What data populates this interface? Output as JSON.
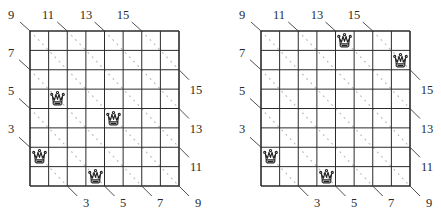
{
  "figure": {
    "grid_size": 8,
    "colors": {
      "grid_line": "#2b2b2b",
      "diagonal_dots": "#b8b8b8",
      "leader_line": "#3a3a3a",
      "label_text": "#2a2a2a",
      "queen_stroke": "#222222"
    }
  },
  "boards": [
    {
      "id": "left",
      "top_labels": [
        "9",
        "11",
        "13",
        "15"
      ],
      "left_labels": [
        "7",
        "5",
        "3"
      ],
      "right_labels": [
        "15",
        "13",
        "11",
        "9"
      ],
      "bottom_labels": [
        "3",
        "5",
        "7"
      ],
      "queens": [
        {
          "row": 3,
          "col": 1
        },
        {
          "row": 4,
          "col": 4
        },
        {
          "row": 6,
          "col": 0
        },
        {
          "row": 7,
          "col": 3
        }
      ]
    },
    {
      "id": "right",
      "top_labels": [
        "9",
        "11",
        "13",
        "15"
      ],
      "left_labels": [
        "7",
        "5",
        "3"
      ],
      "right_labels": [
        "15",
        "13",
        "11",
        "9"
      ],
      "bottom_labels": [
        "3",
        "5",
        "7"
      ],
      "queens": [
        {
          "row": 0,
          "col": 4
        },
        {
          "row": 1,
          "col": 7
        },
        {
          "row": 6,
          "col": 0
        },
        {
          "row": 7,
          "col": 3
        }
      ]
    }
  ]
}
